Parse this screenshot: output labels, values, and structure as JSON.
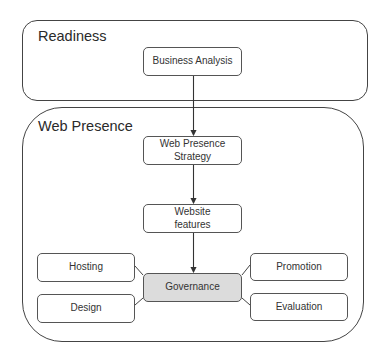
{
  "diagram": {
    "groups": [
      {
        "id": "readiness",
        "label": "Readiness"
      },
      {
        "id": "web-presence",
        "label": "Web Presence"
      }
    ],
    "nodes": [
      {
        "id": "business-analysis",
        "label": "Business Analysis",
        "group": "readiness"
      },
      {
        "id": "web-presence-strategy",
        "label": "Web Presence Strategy",
        "group": "web-presence"
      },
      {
        "id": "website-features",
        "label": "Website features",
        "group": "web-presence"
      },
      {
        "id": "governance",
        "label": "Governance",
        "group": "web-presence",
        "highlighted": true
      },
      {
        "id": "hosting",
        "label": "Hosting",
        "group": "web-presence"
      },
      {
        "id": "design",
        "label": "Design",
        "group": "web-presence"
      },
      {
        "id": "promotion",
        "label": "Promotion",
        "group": "web-presence"
      },
      {
        "id": "evaluation",
        "label": "Evaluation",
        "group": "web-presence"
      }
    ],
    "edges": [
      {
        "from": "business-analysis",
        "to": "web-presence-strategy",
        "arrow": true
      },
      {
        "from": "web-presence-strategy",
        "to": "website-features",
        "arrow": true
      },
      {
        "from": "website-features",
        "to": "governance",
        "arrow": true
      },
      {
        "from": "governance",
        "to": "hosting",
        "arrow": false
      },
      {
        "from": "governance",
        "to": "design",
        "arrow": false
      },
      {
        "from": "governance",
        "to": "promotion",
        "arrow": false
      },
      {
        "from": "governance",
        "to": "evaluation",
        "arrow": false
      }
    ],
    "colors": {
      "stroke": "#444444",
      "highlight_fill": "#dcdcdc",
      "node_fill": "#ffffff"
    }
  }
}
